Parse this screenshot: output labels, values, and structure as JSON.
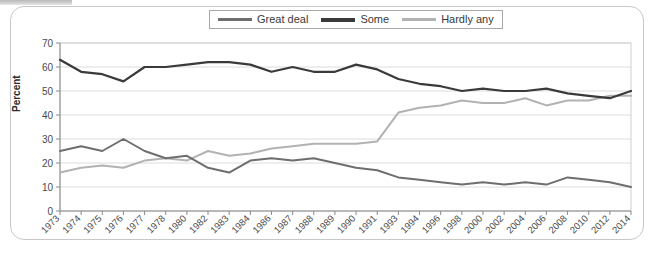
{
  "chart_data": {
    "type": "line",
    "title": "",
    "xlabel": "",
    "ylabel": "Percent",
    "ylim": [
      0,
      70
    ],
    "ytick_step": 10,
    "yticks": [
      0,
      10,
      20,
      30,
      40,
      50,
      60,
      70
    ],
    "grid": true,
    "legend_position": "top-center",
    "categories": [
      "1973",
      "1974",
      "1975",
      "1976",
      "1977",
      "1978",
      "1980",
      "1982",
      "1983",
      "1984",
      "1986",
      "1987",
      "1988",
      "1989",
      "1990",
      "1991",
      "1993",
      "1994",
      "1996",
      "1998",
      "2000",
      "2002",
      "2004",
      "2006",
      "2008",
      "2010",
      "2012",
      "2014"
    ],
    "series": [
      {
        "name": "Great deal",
        "color": "#6e6e6e",
        "values": [
          25,
          27,
          25,
          30,
          25,
          22,
          23,
          18,
          16,
          21,
          22,
          21,
          22,
          20,
          18,
          17,
          14,
          13,
          12,
          11,
          12,
          11,
          12,
          11,
          14,
          13,
          12,
          10
        ]
      },
      {
        "name": "Some",
        "color": "#3a3a3a",
        "values": [
          63,
          58,
          57,
          54,
          60,
          60,
          61,
          62,
          62,
          61,
          58,
          60,
          58,
          58,
          61,
          59,
          55,
          53,
          52,
          50,
          51,
          50,
          50,
          51,
          49,
          48,
          47,
          50
        ]
      },
      {
        "name": "Hardly any",
        "color": "#b2b2b2",
        "values": [
          16,
          18,
          19,
          18,
          21,
          22,
          21,
          25,
          23,
          24,
          26,
          27,
          28,
          28,
          28,
          29,
          41,
          43,
          44,
          46,
          45,
          45,
          47,
          44,
          46,
          46,
          48,
          48
        ]
      }
    ]
  },
  "legend": {
    "items": [
      {
        "label": "Great deal",
        "color": "#6e6e6e"
      },
      {
        "label": "Some",
        "color": "#3a3a3a"
      },
      {
        "label": "Hardly any",
        "color": "#b2b2b2"
      }
    ]
  },
  "axis": {
    "y_title": "Percent"
  }
}
